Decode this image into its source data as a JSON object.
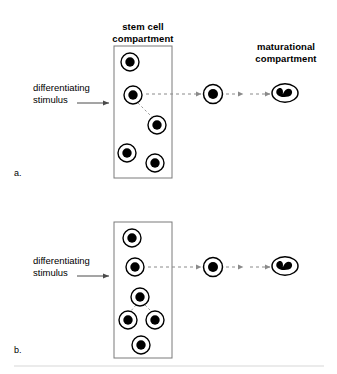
{
  "figure": {
    "title_stem": "stem cell\ncompartment",
    "title_maturational": "maturational\ncompartment",
    "stimulus_label": "differentiating\nstimulus",
    "panel_a_letter": "a.",
    "panel_b_letter": "b.",
    "colors": {
      "ink": "#000000",
      "background": "#ffffff",
      "dashed_arrow": "#8a8a8a",
      "box_border": "#7a7a7a",
      "divider": "#d8d8d8"
    }
  },
  "panels": [
    {
      "id": "a",
      "letter": "a.",
      "compartment_box": {
        "x": 114,
        "y": 46,
        "width": 58,
        "height": 132
      },
      "stem_cells": [
        {
          "id": "a-cell-1",
          "cx": 130,
          "cy": 62,
          "r": 9
        },
        {
          "id": "a-cell-2",
          "cx": 133,
          "cy": 95,
          "r": 9
        },
        {
          "id": "a-cell-3",
          "cx": 157,
          "cy": 125,
          "r": 9
        },
        {
          "id": "a-cell-4",
          "cx": 127,
          "cy": 153,
          "r": 9
        },
        {
          "id": "a-cell-5",
          "cx": 155,
          "cy": 163,
          "r": 9
        }
      ],
      "connectors": [
        {
          "from": "a-cell-2",
          "to": "a-cell-3",
          "style": "dashed-line"
        }
      ],
      "transit_cell": {
        "id": "a-transit-cell",
        "cx": 213,
        "cy": 94,
        "r": 9
      },
      "mature_cell": {
        "id": "a-mature-cell",
        "cx": 285,
        "cy": 93,
        "rx": 13,
        "ry": 9
      },
      "arrows": [
        {
          "id": "a-arrow-long",
          "x1": 146,
          "y1": 94,
          "x2": 202,
          "y2": 94,
          "style": "dashed"
        },
        {
          "id": "a-arrow-short-1",
          "x1": 225,
          "y1": 94,
          "x2": 243,
          "y2": 94,
          "style": "dashed"
        },
        {
          "id": "a-arrow-short-2",
          "x1": 249,
          "y1": 94,
          "x2": 270,
          "y2": 94,
          "style": "dashed"
        }
      ],
      "stimulus_arrow": {
        "x1": 77,
        "y1": 103,
        "x2": 110,
        "y2": 103
      }
    },
    {
      "id": "b",
      "letter": "b.",
      "compartment_box": {
        "x": 114,
        "y": 222,
        "width": 58,
        "height": 136
      },
      "stem_cells": [
        {
          "id": "b-cell-1",
          "cx": 132,
          "cy": 238,
          "r": 9
        },
        {
          "id": "b-cell-2",
          "cx": 135,
          "cy": 267,
          "r": 9
        },
        {
          "id": "b-cell-3",
          "cx": 140,
          "cy": 297,
          "r": 9
        },
        {
          "id": "b-cell-4",
          "cx": 128,
          "cy": 320,
          "r": 9
        },
        {
          "id": "b-cell-5",
          "cx": 155,
          "cy": 320,
          "r": 9
        },
        {
          "id": "b-cell-6",
          "cx": 141,
          "cy": 345,
          "r": 9
        }
      ],
      "connectors": [
        {
          "from": "b-cell-3",
          "to": "b-cell-4",
          "style": "dashed-line"
        },
        {
          "from": "b-cell-3",
          "to": "b-cell-5",
          "style": "dashed-line"
        }
      ],
      "transit_cell": {
        "id": "b-transit-cell",
        "cx": 213,
        "cy": 267,
        "r": 9
      },
      "mature_cell": {
        "id": "b-mature-cell",
        "cx": 285,
        "cy": 266,
        "rx": 13,
        "ry": 9
      },
      "arrows": [
        {
          "id": "b-arrow-long",
          "x1": 148,
          "y1": 267,
          "x2": 202,
          "y2": 267,
          "style": "dashed"
        },
        {
          "id": "b-arrow-short-1",
          "x1": 225,
          "y1": 267,
          "x2": 243,
          "y2": 267,
          "style": "dashed"
        },
        {
          "id": "b-arrow-short-2",
          "x1": 249,
          "y1": 267,
          "x2": 270,
          "y2": 267,
          "style": "dashed"
        }
      ],
      "stimulus_arrow": {
        "x1": 77,
        "y1": 276,
        "x2": 110,
        "y2": 276
      }
    }
  ],
  "divider": {
    "x1": 14,
    "y1": 366,
    "x2": 324,
    "y2": 366
  }
}
